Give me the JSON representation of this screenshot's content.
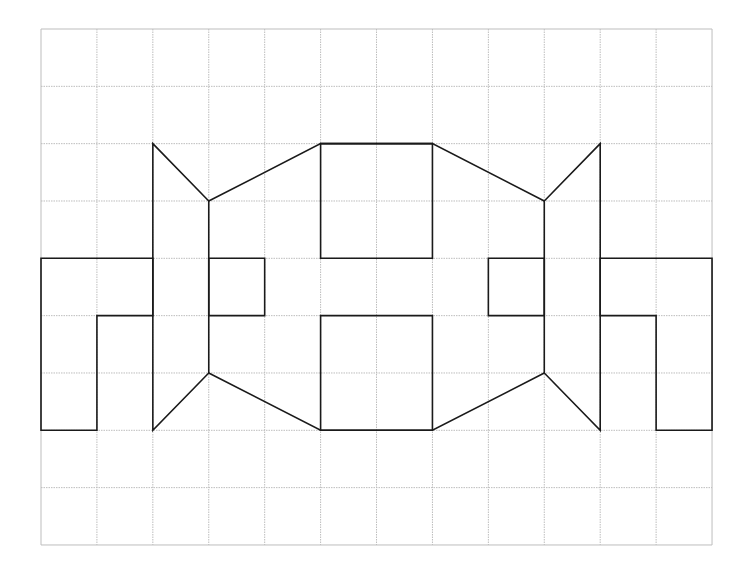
{
  "diagram": {
    "type": "grid-line-drawing",
    "grid": {
      "columns": 12,
      "rows": 9,
      "origin_px": [
        41,
        29
      ],
      "cell_w": 55.92,
      "cell_h": 57.33,
      "line_color": "#bdbdbd",
      "line_style": "dotted"
    },
    "stroke_color": "#1a1a1a",
    "stroke_width": 1.6,
    "shapes": [
      {
        "name": "left-hook",
        "points": [
          [
            0,
            4
          ],
          [
            2,
            4
          ],
          [
            2,
            5
          ],
          [
            1,
            5
          ],
          [
            1,
            7
          ],
          [
            0,
            7
          ]
        ]
      },
      {
        "name": "left-fin-outer",
        "points": [
          [
            2,
            2
          ],
          [
            3,
            3
          ],
          [
            3,
            6
          ],
          [
            2,
            7
          ]
        ]
      },
      {
        "name": "left-body-top-edge",
        "points": [
          [
            3,
            3
          ],
          [
            5,
            2
          ],
          [
            7,
            2
          ],
          [
            9,
            3
          ]
        ]
      },
      {
        "name": "left-body-bottom-edge",
        "points": [
          [
            3,
            6
          ],
          [
            5,
            7
          ],
          [
            7,
            7
          ],
          [
            9,
            6
          ]
        ]
      },
      {
        "name": "left-inner-square",
        "points": [
          [
            3,
            4
          ],
          [
            4,
            4
          ],
          [
            4,
            5
          ],
          [
            3,
            5
          ]
        ]
      },
      {
        "name": "top-center-square",
        "points": [
          [
            5,
            2
          ],
          [
            7,
            2
          ],
          [
            7,
            4
          ],
          [
            5,
            4
          ]
        ]
      },
      {
        "name": "bottom-center-square",
        "points": [
          [
            5,
            5
          ],
          [
            7,
            5
          ],
          [
            7,
            7
          ],
          [
            5,
            7
          ]
        ]
      },
      {
        "name": "right-inner-square",
        "points": [
          [
            8,
            4
          ],
          [
            9,
            4
          ],
          [
            9,
            5
          ],
          [
            8,
            5
          ]
        ]
      },
      {
        "name": "right-fin-outer",
        "points": [
          [
            10,
            2
          ],
          [
            9,
            3
          ],
          [
            9,
            6
          ],
          [
            10,
            7
          ]
        ]
      },
      {
        "name": "right-hook",
        "points": [
          [
            10,
            4
          ],
          [
            12,
            4
          ],
          [
            12,
            7
          ],
          [
            11,
            7
          ],
          [
            11,
            5
          ],
          [
            10,
            5
          ]
        ]
      }
    ]
  }
}
